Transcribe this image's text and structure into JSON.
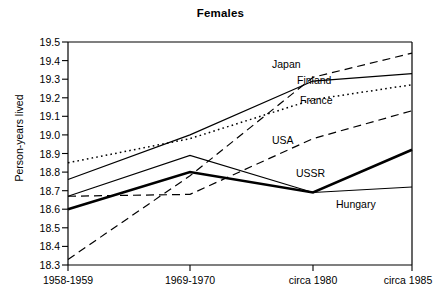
{
  "chart_data": {
    "type": "line",
    "title": "Females",
    "xlabel": "",
    "ylabel": "Person-years lived",
    "categories": [
      "1958-1959",
      "1969-1970",
      "circa 1980",
      "circa 1985"
    ],
    "ylim": [
      18.3,
      19.5
    ],
    "ytick_step": 0.1,
    "yticks": [
      "19.5",
      "19.4",
      "19.3",
      "19.2",
      "19.1",
      "19.0",
      "18.9",
      "18.8",
      "18.7",
      "18.6",
      "18.5",
      "18.4",
      "18.3"
    ],
    "grid": false,
    "legend_position": "inline-annotations",
    "series": [
      {
        "name": "Japan",
        "style": "dashed",
        "width": 1.2,
        "values": [
          18.33,
          18.78,
          19.31,
          19.44
        ]
      },
      {
        "name": "Finland",
        "style": "solid",
        "width": 1.2,
        "values": [
          18.76,
          19.0,
          19.29,
          19.33
        ]
      },
      {
        "name": "France",
        "style": "dotted",
        "width": 1.5,
        "values": [
          18.85,
          18.98,
          19.19,
          19.27
        ]
      },
      {
        "name": "USA",
        "style": "dashed",
        "width": 1.2,
        "values": [
          18.67,
          18.68,
          18.98,
          19.13
        ]
      },
      {
        "name": "USSR",
        "style": "solid-bold",
        "width": 2.6,
        "values": [
          18.6,
          18.8,
          18.69,
          18.92
        ]
      },
      {
        "name": "Hungary",
        "style": "solid",
        "width": 1.1,
        "values": [
          18.67,
          18.89,
          18.69,
          18.72
        ]
      }
    ],
    "annotations": [
      {
        "text": "Japan",
        "x_px": 272,
        "y_px": 58
      },
      {
        "text": "Finland",
        "x_px": 297,
        "y_px": 74
      },
      {
        "text": "France",
        "x_px": 300,
        "y_px": 94
      },
      {
        "text": "USA",
        "x_px": 272,
        "y_px": 134
      },
      {
        "text": "USSR",
        "x_px": 296,
        "y_px": 167
      },
      {
        "text": "Hungary",
        "x_px": 336,
        "y_px": 198
      }
    ]
  },
  "colors": {
    "line": "#000000",
    "axis": "#000000",
    "background": "#ffffff",
    "text": "#000000"
  }
}
